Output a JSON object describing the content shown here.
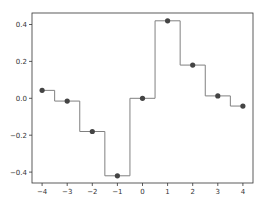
{
  "chart_data": {
    "type": "line",
    "style": "step-mid",
    "title": "",
    "xlabel": "",
    "ylabel": "",
    "xlim": [
      -4.4,
      4.4
    ],
    "ylim": [
      -0.46,
      0.46
    ],
    "x": [
      -4,
      -3,
      -2,
      -1,
      0,
      1,
      2,
      3,
      4
    ],
    "series": [
      {
        "name": "values",
        "values": [
          0.043,
          -0.015,
          -0.18,
          -0.42,
          0.0,
          0.42,
          0.18,
          0.013,
          -0.042
        ]
      }
    ],
    "xticks": [
      -4,
      -3,
      -2,
      -1,
      0,
      1,
      2,
      3,
      4
    ],
    "xtick_labels": [
      "−4",
      "−3",
      "−2",
      "−1",
      "0",
      "1",
      "2",
      "3",
      "4"
    ],
    "yticks": [
      0.4,
      0.2,
      0.0,
      -0.2,
      -0.4
    ],
    "ytick_labels": [
      "0.4",
      "0.2",
      "0.0",
      "−0.2",
      "−0.4"
    ],
    "grid": false,
    "legend": null,
    "colors": {
      "line": "#808080",
      "marker": "#444444",
      "axes": "#333333"
    }
  }
}
